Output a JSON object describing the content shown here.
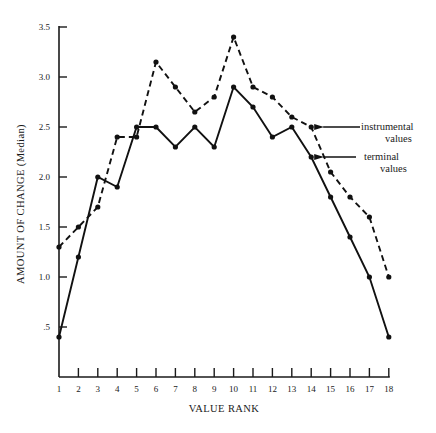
{
  "chart_data": {
    "type": "line",
    "title": "",
    "xlabel": "VALUE RANK",
    "ylabel": "AMOUNT OF CHANGE  (Median)",
    "x": [
      1,
      2,
      3,
      4,
      5,
      6,
      7,
      8,
      9,
      10,
      11,
      12,
      13,
      14,
      15,
      16,
      17,
      18
    ],
    "x_tick_labels": [
      "1",
      "2",
      "3",
      "4",
      "5",
      "6",
      "7",
      "8",
      "9",
      "10",
      "11",
      "12",
      "13",
      "14",
      "15",
      "16",
      "17",
      "18"
    ],
    "y_ticks": [
      0.5,
      1.0,
      1.5,
      2.0,
      2.5,
      3.0,
      3.5
    ],
    "y_tick_labels": [
      ".5",
      "1.0",
      "1.5",
      "2.0",
      "2.5",
      "3.0",
      "3.5"
    ],
    "ylim": [
      0,
      3.5
    ],
    "xlim": [
      1,
      18
    ],
    "grid": false,
    "legend": "inline arrow annotations at right",
    "series": [
      {
        "name": "instrumental values",
        "style": "dashed",
        "values": [
          1.3,
          1.5,
          1.7,
          2.4,
          2.4,
          3.15,
          2.9,
          2.65,
          2.8,
          3.4,
          2.9,
          2.8,
          2.6,
          2.5,
          2.05,
          1.8,
          1.6,
          1.0
        ]
      },
      {
        "name": "terminal values",
        "style": "solid",
        "values": [
          0.4,
          1.2,
          2.0,
          1.9,
          2.5,
          2.5,
          2.3,
          2.5,
          2.3,
          2.9,
          2.7,
          2.4,
          2.5,
          2.2,
          1.8,
          1.4,
          1.0,
          0.4
        ]
      }
    ],
    "annotations": [
      {
        "series": "instrumental values",
        "line1": "instrumental",
        "line2": "values",
        "points_to_rank": 14
      },
      {
        "series": "terminal values",
        "line1": "terminal",
        "line2": "values",
        "points_to_rank": 14
      }
    ]
  }
}
